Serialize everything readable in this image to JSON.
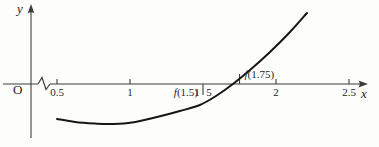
{
  "axes": {
    "x_label": "x",
    "y_label": "y",
    "origin_label": "O",
    "axis_break_shown": true
  },
  "colors": {
    "curve_ink": "#161616",
    "axis_ink": "#3c3c3c",
    "text_ink": "#262626",
    "background": "#fdfdfc"
  },
  "chart_data": {
    "type": "line",
    "title": "",
    "xlabel": "x",
    "ylabel": "y",
    "xlim_shown": [
      0.5,
      2.5
    ],
    "grid": false,
    "legend": false,
    "axis_break_before_first_tick": true,
    "x_ticks": [
      {
        "value": 0.5,
        "label": "0.5",
        "dir": "up",
        "len": 5,
        "split": false
      },
      {
        "value": 1,
        "label": "1",
        "dir": "up",
        "len": 5,
        "split": false
      },
      {
        "value": 1.5,
        "label": "1.5",
        "dir": "down",
        "len": 11,
        "split": true
      },
      {
        "value": 1.75,
        "label": "",
        "dir": "up",
        "len": 10,
        "split": false
      },
      {
        "value": 2,
        "label": "2",
        "dir": "up",
        "len": 5,
        "split": false
      },
      {
        "value": 2.5,
        "label": "2.5",
        "dir": "up",
        "len": 5,
        "split": false
      }
    ],
    "series": [
      {
        "name": "f",
        "points": [
          [
            0.5,
            -0.24
          ],
          [
            0.623,
            -0.26
          ],
          [
            0.76,
            -0.271
          ],
          [
            0.877,
            -0.274
          ],
          [
            1.014,
            -0.264
          ],
          [
            1.185,
            -0.226
          ],
          [
            1.342,
            -0.185
          ],
          [
            1.479,
            -0.144
          ],
          [
            1.589,
            -0.082
          ],
          [
            1.705,
            0.0
          ],
          [
            1.822,
            0.096
          ],
          [
            1.959,
            0.219
          ],
          [
            2.096,
            0.356
          ],
          [
            2.212,
            0.486
          ]
        ]
      }
    ],
    "annotations": [
      {
        "text": "f(1.5)",
        "anchor_x": 1.5,
        "placement": "below-left"
      },
      {
        "text": "f(1.75)",
        "anchor_x": 1.75,
        "placement": "above-right"
      }
    ]
  }
}
